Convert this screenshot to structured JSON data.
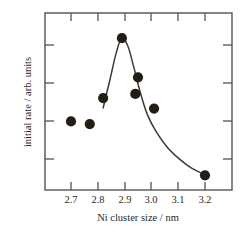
{
  "chart_data": {
    "type": "scatter",
    "title": "",
    "xlabel": "Ni cluster size / nm",
    "ylabel": "initial rate / arb. units",
    "xlim": [
      2.645,
      2.645
    ],
    "x_ticks": [
      2.7,
      2.8,
      2.9,
      3.0,
      3.1,
      3.2
    ],
    "x_tick_labels": [
      "2.7",
      "2.8",
      "2.9",
      "3.0",
      "3.1",
      "3.2"
    ],
    "y_ticks": [
      1,
      2,
      3,
      4
    ],
    "y_tick_labels": [
      "",
      "",
      "",
      ""
    ],
    "y_axis_labeled": false,
    "grid": false,
    "legend": null,
    "marker_style": "filled-circle",
    "marker_color": "#231d16",
    "curve_color": "#3b3a36",
    "frame_color": "#55544f",
    "axes_box": true,
    "ticks_direction": "inward",
    "points": [
      {
        "x": 2.7,
        "y": 1.82
      },
      {
        "x": 2.77,
        "y": 1.75
      },
      {
        "x": 2.82,
        "y": 2.44
      },
      {
        "x": 2.89,
        "y": 4.03
      },
      {
        "x": 2.94,
        "y": 2.55
      },
      {
        "x": 2.95,
        "y": 2.99
      },
      {
        "x": 3.01,
        "y": 2.16
      },
      {
        "x": 3.2,
        "y": 0.39
      }
    ],
    "series": [
      {
        "name": "initial rate",
        "x": [
          2.7,
          2.77,
          2.82,
          2.89,
          2.94,
          2.95,
          3.01,
          3.2
        ],
        "values": [
          1.82,
          1.75,
          2.44,
          4.03,
          2.55,
          2.99,
          2.16,
          0.39
        ]
      }
    ],
    "fit_curve": {
      "name": "guide-to-the-eye curve",
      "x": [
        2.82,
        2.845,
        2.868,
        2.889,
        2.912,
        2.935,
        2.958,
        2.985,
        3.02,
        3.06,
        3.105,
        3.15,
        3.2
      ],
      "values": [
        2.18,
        2.92,
        3.62,
        4.03,
        3.82,
        3.24,
        2.6,
        2.0,
        1.52,
        1.13,
        0.82,
        0.58,
        0.4
      ]
    },
    "annotations": []
  }
}
